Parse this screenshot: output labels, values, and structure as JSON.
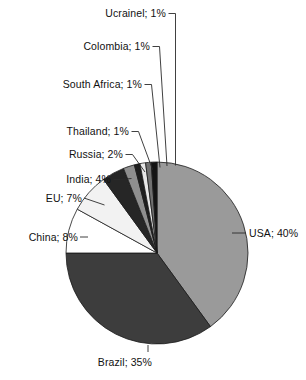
{
  "chart_data": {
    "type": "pie",
    "title": "",
    "subtitle": "",
    "xlabel": "",
    "ylabel": "",
    "legend_position": "none",
    "grid": false,
    "label_separator": "; ",
    "value_suffix": "%",
    "start_angle_deg": 0,
    "direction": "clockwise",
    "categories": [
      "USA",
      "Brazil",
      "China",
      "EU",
      "India",
      "Russia",
      "Thailand",
      "South Africa",
      "Colombia",
      "Ucrainel"
    ],
    "values": [
      40,
      35,
      8,
      7,
      4,
      2,
      1,
      1,
      1,
      1
    ],
    "slices": [
      {
        "name": "USA",
        "value": 40,
        "label": "USA; 40%",
        "color": "#9a9a9a"
      },
      {
        "name": "Brazil",
        "value": 35,
        "label": "Brazil; 35%",
        "color": "#3d3d3d"
      },
      {
        "name": "China",
        "value": 8,
        "label": "China; 8%",
        "color": "#ffffff"
      },
      {
        "name": "EU",
        "value": 7,
        "label": "EU; 7%",
        "color": "#f2f2f2"
      },
      {
        "name": "India",
        "value": 4,
        "label": "India; 4%",
        "color": "#262626"
      },
      {
        "name": "Russia",
        "value": 2,
        "label": "Russia; 2%",
        "color": "#8f8f8f"
      },
      {
        "name": "Thailand",
        "value": 1,
        "label": "Thailand; 1%",
        "color": "#1f1f1f"
      },
      {
        "name": "South Africa",
        "value": 1,
        "label": "South Africa; 1%",
        "color": "#e8e8e8"
      },
      {
        "name": "Colombia",
        "value": 1,
        "label": "Colombia; 1%",
        "color": "#707070"
      },
      {
        "name": "Ucrainel",
        "value": 1,
        "label": "Ucrainel; 1%",
        "color": "#141414"
      }
    ]
  },
  "labels": {
    "usa": "USA; 40%",
    "brazil": "Brazil; 35%",
    "china": "China; 8%",
    "eu": "EU; 7%",
    "india": "India; 4%",
    "russia": "Russia; 2%",
    "thailand": "Thailand; 1%",
    "south_africa": "South Africa; 1%",
    "colombia": "Colombia; 1%",
    "ucrainel": "Ucrainel; 1%"
  },
  "colors": {
    "background": "#ffffff",
    "outline": "#1a1a1a",
    "leader_line": "#2b2b2b",
    "text": "#111111"
  },
  "geometry": {
    "center_x": 157,
    "center_y": 253,
    "radius": 91
  }
}
